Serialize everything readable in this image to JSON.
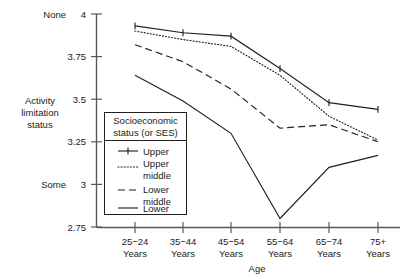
{
  "chart_data": {
    "type": "line",
    "title": "",
    "xlabel": "Age",
    "ylabel": "Activity limitation status",
    "ylim": [
      2.75,
      4
    ],
    "yticks": [
      "2.75",
      "3",
      "3.25",
      "3.5",
      "3.75",
      "4"
    ],
    "ytick_values": [
      2.75,
      3,
      3.25,
      3.5,
      3.75,
      4
    ],
    "y_axis_anchor_high": "None",
    "y_axis_anchor_low": "Some",
    "grid": false,
    "legend_position": "inside-lower-left",
    "legend_title_line1": "Socioeconomic",
    "legend_title_line2": "status (or SES)",
    "categories": [
      "25−24 Years",
      "35−44 Years",
      "45−54 Years",
      "55−64 Years",
      "65−74 Years",
      "75+ Years"
    ],
    "category_lines": [
      [
        "25−24",
        "Years"
      ],
      [
        "35−44",
        "Years"
      ],
      [
        "45−54",
        "Years"
      ],
      [
        "55−64",
        "Years"
      ],
      [
        "65−74",
        "Years"
      ],
      [
        "75+",
        "Years"
      ]
    ],
    "series": [
      {
        "name": "Upper",
        "style": "solid-with-plus-markers",
        "values": [
          3.93,
          3.89,
          3.87,
          3.68,
          3.48,
          3.44
        ]
      },
      {
        "name": "Upper middle",
        "label_lines": [
          "Upper",
          "middle"
        ],
        "style": "dotted",
        "values": [
          3.9,
          3.85,
          3.81,
          3.64,
          3.4,
          3.26
        ]
      },
      {
        "name": "Lower middle",
        "label_lines": [
          "Lower",
          "middle"
        ],
        "style": "dashed",
        "values": [
          3.82,
          3.72,
          3.56,
          3.33,
          3.35,
          3.25
        ]
      },
      {
        "name": "Lower",
        "label_lines": [
          "Lower"
        ],
        "style": "solid",
        "values": [
          3.64,
          3.49,
          3.3,
          2.8,
          3.1,
          3.17
        ]
      }
    ]
  },
  "axis": {
    "y_title_lines": [
      "Activity",
      "limitation",
      "status"
    ],
    "x_title": "Age",
    "top_anchor": "None",
    "bottom_anchor": "Some"
  },
  "legend": {
    "title_lines": [
      "Socioeconomic",
      "status (or SES)"
    ],
    "entries": [
      {
        "label": "Upper"
      },
      {
        "label": "Upper middle"
      },
      {
        "label": "Lower middle"
      },
      {
        "label": "Lower"
      }
    ]
  },
  "colors": {
    "ink": "#231f20",
    "axis": "#59595b",
    "background": "#ffffff"
  }
}
